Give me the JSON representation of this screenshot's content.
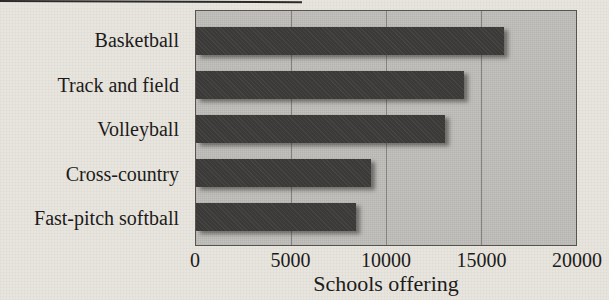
{
  "chart_data": {
    "type": "bar",
    "orientation": "horizontal",
    "title": "",
    "xlabel": "Schools offering",
    "ylabel": "",
    "categories": [
      "Basketball",
      "Track and field",
      "Volleyball",
      "Cross-country",
      "Fast-pitch softball"
    ],
    "values": [
      16200,
      14100,
      13100,
      9200,
      8400
    ],
    "xlim": [
      0,
      20000
    ],
    "xticks": [
      0,
      5000,
      10000,
      15000,
      20000
    ],
    "xtick_labels": [
      "0",
      "5000",
      "10000",
      "15000",
      "20000"
    ],
    "grid": "vertical-gridlines-behind-bars",
    "legend": "none",
    "colors": {
      "bar": "#3b3a38",
      "plot_background": "#c3c2be",
      "page_background": "#e8e5df",
      "gridline": "#83827e",
      "plot_border": "#55544e",
      "text": "#1c1b19"
    }
  }
}
